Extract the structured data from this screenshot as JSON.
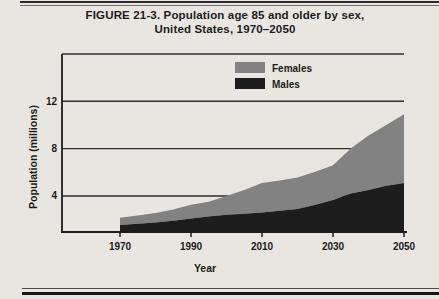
{
  "figure": {
    "title_line1": "FIGURE 21-3. Population age 85 and older by sex,",
    "title_line2": "United States, 1970–2050"
  },
  "colors": {
    "paper": "#e9e6e1",
    "ink": "#1c1c1c",
    "grid_line": "#2e2e2e",
    "females_fill": "#828282",
    "males_fill": "#1d1d1d"
  },
  "chart_data": {
    "type": "area",
    "stacked": true,
    "title": "Population age 85 and older by sex, United States, 1970–2050",
    "xlabel": "Year",
    "ylabel": "Population (millions)",
    "x": [
      1970,
      1975,
      1980,
      1985,
      1990,
      1995,
      2000,
      2005,
      2010,
      2015,
      2020,
      2025,
      2030,
      2035,
      2040,
      2045,
      2050
    ],
    "series": [
      {
        "name": "Males",
        "color": "#1d1d1d",
        "values": [
          1.55,
          1.65,
          1.75,
          1.9,
          2.1,
          2.25,
          2.4,
          2.5,
          2.6,
          2.75,
          2.9,
          3.25,
          3.65,
          4.2,
          4.5,
          4.85,
          5.1
        ]
      },
      {
        "name": "Females",
        "color": "#828282",
        "values": [
          0.6,
          0.7,
          0.8,
          0.95,
          1.15,
          1.25,
          1.6,
          2.0,
          2.5,
          2.55,
          2.65,
          2.8,
          2.95,
          3.8,
          4.6,
          5.15,
          5.8
        ]
      }
    ],
    "x_ticks": [
      1970,
      1990,
      2010,
      2030,
      2050
    ],
    "y_ticks": [
      4,
      8,
      12
    ],
    "xlim": [
      1970,
      2050
    ],
    "ylim": [
      0.95,
      16
    ],
    "grid": "horizontal",
    "legend_position": "top-inside"
  }
}
